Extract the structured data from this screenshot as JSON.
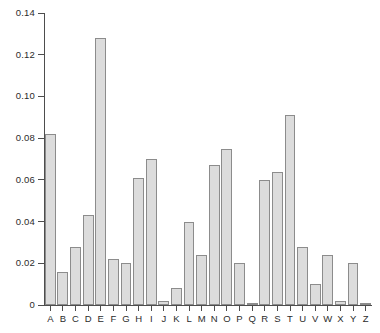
{
  "chart_data": {
    "type": "bar",
    "title": "",
    "subtitle": "",
    "xlabel": "",
    "ylabel": "",
    "categories": [
      "A",
      "B",
      "C",
      "D",
      "E",
      "F",
      "G",
      "H",
      "I",
      "J",
      "K",
      "L",
      "M",
      "N",
      "O",
      "P",
      "Q",
      "R",
      "S",
      "T",
      "U",
      "V",
      "W",
      "X",
      "Y",
      "Z"
    ],
    "values": [
      0.082,
      0.016,
      0.028,
      0.043,
      0.128,
      0.022,
      0.02,
      0.061,
      0.07,
      0.002,
      0.008,
      0.04,
      0.024,
      0.067,
      0.075,
      0.02,
      0.001,
      0.06,
      0.064,
      0.091,
      0.028,
      0.01,
      0.024,
      0.002,
      0.02,
      0.001
    ],
    "ylim": [
      0,
      0.14
    ],
    "xlim_categorical": true,
    "ytick_values": [
      0,
      0.02,
      0.04,
      0.06,
      0.08,
      0.1,
      0.12,
      0.14
    ],
    "ytick_labels": [
      "0",
      "0.02",
      "0.04",
      "0.06",
      "0.08",
      "0.10",
      "0.12",
      "0.14"
    ],
    "grid": false,
    "legend": null,
    "legend_position": "none",
    "bar_fill_color": "#dcdcdc",
    "bar_edge_color": "#8c8c8c",
    "axis_color": "#4d4d4d",
    "text_color": "#2b2b2b",
    "background_color": "#ffffff",
    "annotations": []
  }
}
